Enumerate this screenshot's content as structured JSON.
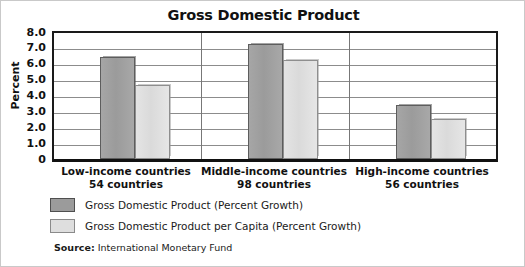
{
  "chart_data": {
    "type": "bar",
    "title": "Gross Domestic Product",
    "xlabel": "",
    "ylabel": "Percent",
    "ylim": [
      0,
      8.0
    ],
    "yticks": [
      "0",
      "1.0",
      "2.0",
      "3.0",
      "4.0",
      "5.0",
      "6.0",
      "7.0",
      "8.0"
    ],
    "grid": true,
    "legend_position": "below-plot-left",
    "categories": [
      "Low-income countries",
      "Middle-income countries",
      "High-income countries"
    ],
    "category_sublabels": [
      "54 countries",
      "98 countries",
      "56 countries"
    ],
    "series": [
      {
        "name": "Gross Domestic Product (Percent Growth)",
        "color": "#9b9b9b",
        "values": [
          6.4,
          7.2,
          3.4
        ]
      },
      {
        "name": "Gross Domestic Product per Capita (Percent Growth)",
        "color": "#dedede",
        "values": [
          4.6,
          6.2,
          2.5
        ]
      }
    ],
    "source_label": "Source:",
    "source_text": "International Monetary Fund"
  }
}
